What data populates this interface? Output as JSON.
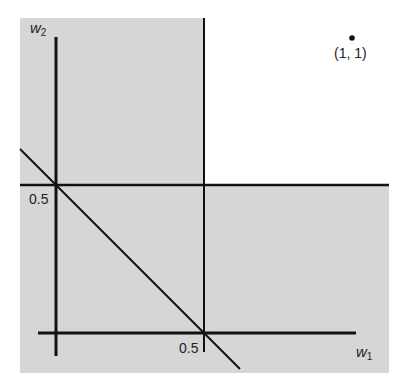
{
  "diagram": {
    "title": "",
    "colors": {
      "shade": "#d6d6d6",
      "background": "#ffffff",
      "line": "#111111"
    },
    "axes": {
      "x_label": {
        "var": "w",
        "sub": "1"
      },
      "y_label": {
        "var": "w",
        "sub": "2"
      }
    },
    "tick_labels": {
      "x_half": "0.5",
      "y_half": "0.5"
    },
    "point": {
      "label": "(1, 1)",
      "x": 1,
      "y": 1
    },
    "lines": [
      {
        "name": "w1 = 0.5",
        "type": "vertical"
      },
      {
        "name": "w2 = 0.5",
        "type": "horizontal"
      },
      {
        "name": "w1 + w2 = 0.5",
        "type": "diagonal"
      }
    ],
    "shaded_region": "all points except w1 > 0.5 and w2 > 0.5"
  }
}
